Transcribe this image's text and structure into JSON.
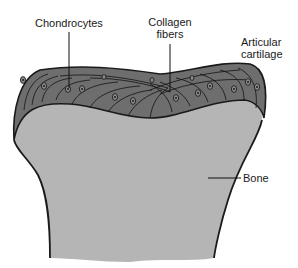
{
  "diagram": {
    "labels": {
      "chondrocytes": "Chondrocytes",
      "collagen_line1": "Collagen",
      "collagen_line2": "fibers",
      "articular_line1": "Articular",
      "articular_line2": "cartilage",
      "bone": "Bone"
    },
    "colors": {
      "cartilage": "#6e6e6e",
      "bone": "#b5b5b5",
      "outline": "#1a1a1a",
      "background": "#ffffff"
    }
  }
}
